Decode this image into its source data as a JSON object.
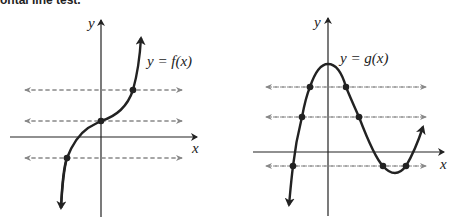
{
  "caption": "ontal line test.",
  "figures": [
    {
      "id": "left",
      "function_label": "y = f(x)",
      "x_axis_label": "x",
      "y_axis_label": "y",
      "horizontal_lines": 3,
      "intersections_per_line": [
        1,
        1,
        1
      ]
    },
    {
      "id": "right",
      "function_label": "y = g(x)",
      "x_axis_label": "x",
      "y_axis_label": "y",
      "horizontal_lines": 3,
      "intersections_per_line": [
        2,
        2,
        3
      ]
    }
  ],
  "colors": {
    "ink": "#222222",
    "dashed": "#777777"
  }
}
